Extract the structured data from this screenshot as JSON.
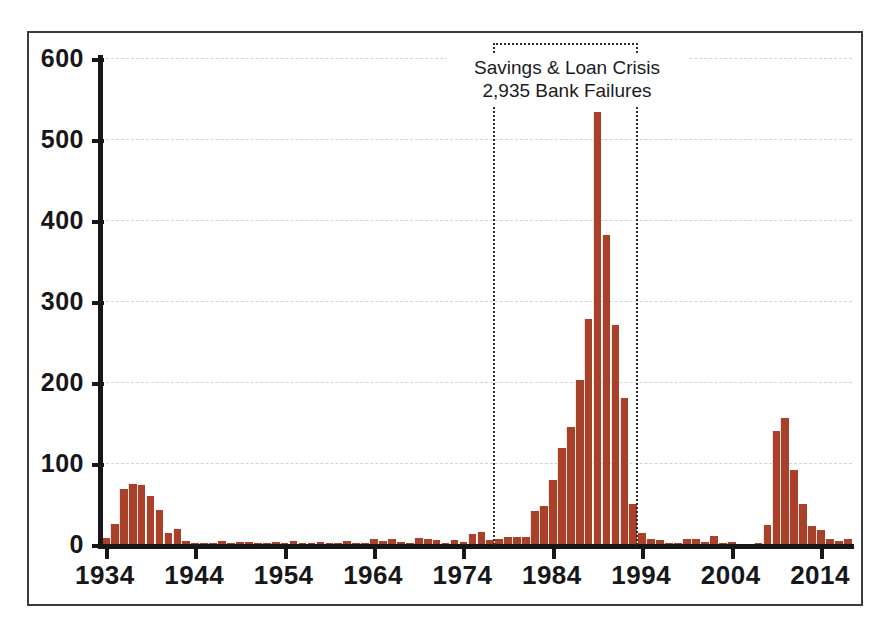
{
  "chart_data": {
    "type": "bar",
    "title": "",
    "subtitle": "",
    "xlabel": "",
    "ylabel": "",
    "xlim": [
      1933.5,
      2017.5
    ],
    "ylim": [
      0,
      600
    ],
    "grid": true,
    "legend": "none",
    "bar_color": "#a8402a",
    "gridline_color": "#c9d6dd",
    "axis_color": "#17171a",
    "y_ticks": [
      0,
      100,
      200,
      300,
      400,
      500,
      600
    ],
    "y_tick_labels": [
      "0",
      "100",
      "200",
      "300",
      "400",
      "500",
      "600"
    ],
    "x_ticks": [
      1934,
      1944,
      1954,
      1964,
      1974,
      1984,
      1994,
      2004,
      2014
    ],
    "x_tick_labels": [
      "1934",
      "1944",
      "1954",
      "1964",
      "1974",
      "1984",
      "1994",
      "2004",
      "2014"
    ],
    "categories": [
      1934,
      1935,
      1936,
      1937,
      1938,
      1939,
      1940,
      1941,
      1942,
      1943,
      1944,
      1945,
      1946,
      1947,
      1948,
      1949,
      1950,
      1951,
      1952,
      1953,
      1954,
      1955,
      1956,
      1957,
      1958,
      1959,
      1960,
      1961,
      1962,
      1963,
      1964,
      1965,
      1966,
      1967,
      1968,
      1969,
      1970,
      1971,
      1972,
      1973,
      1974,
      1975,
      1976,
      1977,
      1978,
      1979,
      1980,
      1981,
      1982,
      1983,
      1984,
      1985,
      1986,
      1987,
      1988,
      1989,
      1990,
      1991,
      1992,
      1993,
      1994,
      1995,
      1996,
      1997,
      1998,
      1999,
      2000,
      2001,
      2002,
      2003,
      2004,
      2005,
      2006,
      2007,
      2008,
      2009,
      2010,
      2011,
      2012,
      2013,
      2014,
      2015,
      2016,
      2017
    ],
    "values": [
      9,
      26,
      69,
      75,
      74,
      60,
      43,
      15,
      20,
      5,
      2,
      1,
      1,
      5,
      3,
      4,
      4,
      2,
      3,
      4,
      2,
      5,
      2,
      2,
      4,
      3,
      1,
      5,
      1,
      2,
      7,
      5,
      7,
      4,
      3,
      9,
      7,
      6,
      1,
      6,
      4,
      13,
      16,
      6,
      7,
      10,
      10,
      10,
      42,
      48,
      80,
      120,
      145,
      203,
      279,
      534,
      382,
      271,
      181,
      50,
      15,
      8,
      6,
      1,
      3,
      8,
      7,
      4,
      11,
      3,
      4,
      0,
      0,
      3,
      25,
      140,
      157,
      92,
      51,
      24,
      18,
      8,
      5,
      8
    ],
    "annotations": [
      {
        "name": "savings-loan-crisis",
        "line1": "Savings & Loan Crisis",
        "line2": "2,935 Bank Failures",
        "span_start": 1979,
        "span_end": 1995,
        "style": "dotted-box"
      }
    ]
  }
}
